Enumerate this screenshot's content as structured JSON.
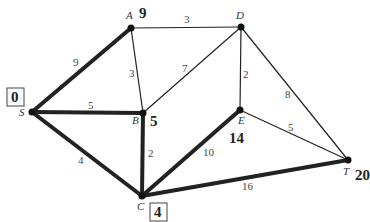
{
  "diagram": {
    "type": "weighted-graph-shortest-path",
    "nodes": [
      {
        "id": "S",
        "label": "S",
        "x": 32,
        "y": 112,
        "distance": "0",
        "boxed": true
      },
      {
        "id": "A",
        "label": "A",
        "x": 131,
        "y": 28,
        "distance": "9",
        "boxed": false
      },
      {
        "id": "B",
        "label": "B",
        "x": 143,
        "y": 113,
        "distance": "5",
        "boxed": false
      },
      {
        "id": "C",
        "label": "C",
        "x": 142,
        "y": 196,
        "distance": "4",
        "boxed": true
      },
      {
        "id": "D",
        "label": "D",
        "x": 241,
        "y": 27,
        "distance": "",
        "boxed": false
      },
      {
        "id": "E",
        "label": "E",
        "x": 240,
        "y": 110,
        "distance": "14",
        "boxed": false
      },
      {
        "id": "T",
        "label": "T",
        "x": 348,
        "y": 160,
        "distance": "20",
        "boxed": false
      }
    ],
    "edges": [
      {
        "from": "S",
        "to": "A",
        "weight": "9",
        "bold": true
      },
      {
        "from": "S",
        "to": "B",
        "weight": "5",
        "bold": true
      },
      {
        "from": "S",
        "to": "C",
        "weight": "4",
        "bold": false
      },
      {
        "from": "A",
        "to": "D",
        "weight": "3",
        "bold": false
      },
      {
        "from": "A",
        "to": "B",
        "weight": "3",
        "bold": false
      },
      {
        "from": "B",
        "to": "D",
        "weight": "7",
        "bold": false
      },
      {
        "from": "B",
        "to": "C",
        "weight": "2",
        "bold": true
      },
      {
        "from": "D",
        "to": "E",
        "weight": "2",
        "bold": false
      },
      {
        "from": "D",
        "to": "T",
        "weight": "8",
        "bold": false
      },
      {
        "from": "E",
        "to": "T",
        "weight": "5",
        "bold": false
      },
      {
        "from": "C",
        "to": "E",
        "weight": "10",
        "bold": true
      },
      {
        "from": "C",
        "to": "T",
        "weight": "16",
        "bold": true
      }
    ]
  }
}
